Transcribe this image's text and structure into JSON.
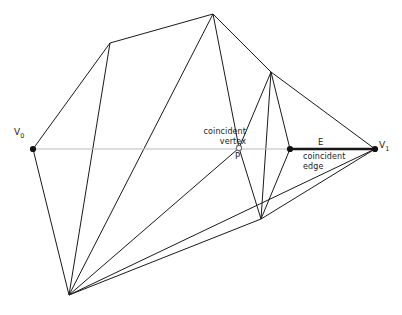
{
  "diagram": {
    "background_color": "#ffffff",
    "edge_color": "#1a1a1a",
    "axis_color": "#b9b9b9",
    "highlight_color": "#171717",
    "labels": {
      "v0": "V",
      "v0_sub": "0",
      "v1": "V",
      "v1_sub": "1",
      "p": "P",
      "e": "E",
      "coincident_vertex_line1": "coincident",
      "coincident_vertex_line2": "vertex",
      "coincident_edge_line1": "coincident",
      "coincident_edge_line2": "edge"
    },
    "points": {
      "v0": {
        "x": 33,
        "y": 149
      },
      "v1": {
        "x": 375,
        "y": 149
      },
      "p": {
        "x": 239,
        "y": 148
      },
      "e_start": {
        "x": 290,
        "y": 149
      },
      "top_apex": {
        "x": 213,
        "y": 14
      },
      "upper_left": {
        "x": 110,
        "y": 43
      },
      "upper_right": {
        "x": 271,
        "y": 72
      },
      "bottom_fan": {
        "x": 69,
        "y": 295
      },
      "lower_mid": {
        "x": 261,
        "y": 219
      }
    },
    "vertex_markers": [
      {
        "name": "v0",
        "x": 33,
        "y": 149,
        "r": 3.1,
        "style": "filled"
      },
      {
        "name": "v1",
        "x": 375,
        "y": 149,
        "r": 3.1,
        "style": "filled"
      },
      {
        "name": "e_start",
        "x": 290,
        "y": 149,
        "r": 3.1,
        "style": "filled"
      },
      {
        "name": "p",
        "x": 239,
        "y": 148,
        "r": 2.6,
        "style": "open"
      }
    ],
    "mesh_edges": [
      {
        "from": "v0",
        "x1": 33,
        "y1": 149,
        "x2": 110,
        "y2": 43
      },
      {
        "from": "upper_left",
        "x1": 110,
        "y1": 43,
        "x2": 213,
        "y2": 14
      },
      {
        "from": "upper_left",
        "x1": 110,
        "y1": 43,
        "x2": 69,
        "y2": 295
      },
      {
        "from": "top_apex",
        "x1": 213,
        "y1": 14,
        "x2": 271,
        "y2": 72
      },
      {
        "from": "top_apex",
        "x1": 213,
        "y1": 14,
        "x2": 239,
        "y2": 148
      },
      {
        "from": "top_apex",
        "x1": 213,
        "y1": 14,
        "x2": 69,
        "y2": 295
      },
      {
        "from": "upper_right",
        "x1": 271,
        "y1": 72,
        "x2": 375,
        "y2": 149
      },
      {
        "from": "upper_right",
        "x1": 271,
        "y1": 72,
        "x2": 290,
        "y2": 149
      },
      {
        "from": "upper_right",
        "x1": 271,
        "y1": 72,
        "x2": 239,
        "y2": 148
      },
      {
        "from": "upper_right",
        "x1": 271,
        "y1": 72,
        "x2": 261,
        "y2": 219
      },
      {
        "from": "p",
        "x1": 239,
        "y1": 148,
        "x2": 261,
        "y2": 219
      },
      {
        "from": "p",
        "x1": 239,
        "y1": 148,
        "x2": 69,
        "y2": 295
      },
      {
        "from": "e_start",
        "x1": 290,
        "y1": 149,
        "x2": 261,
        "y2": 219
      },
      {
        "from": "lower_mid",
        "x1": 261,
        "y1": 219,
        "x2": 375,
        "y2": 149
      },
      {
        "from": "lower_mid",
        "x1": 261,
        "y1": 219,
        "x2": 69,
        "y2": 295
      },
      {
        "from": "bottom_fan",
        "x1": 69,
        "y1": 295,
        "x2": 375,
        "y2": 149
      },
      {
        "from": "v0",
        "x1": 33,
        "y1": 149,
        "x2": 69,
        "y2": 295
      }
    ]
  }
}
